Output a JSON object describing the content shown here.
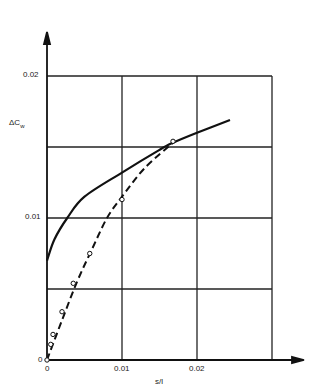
{
  "chart_data": {
    "type": "line",
    "title": "",
    "xlabel": "s/l",
    "ylabel": "ΔCw",
    "xlim": [
      0,
      0.03
    ],
    "ylim": [
      0,
      0.025
    ],
    "x_ticks": [
      "0",
      "0.01",
      "0.02"
    ],
    "y_ticks": [
      "0",
      "0.01",
      "0.02"
    ],
    "grid": true,
    "series": [
      {
        "name": "solid curve",
        "style": "solid",
        "points": [
          [
            0,
            0.007
          ],
          [
            0.001,
            0.0085
          ],
          [
            0.0027,
            0.01
          ],
          [
            0.005,
            0.0115
          ],
          [
            0.01,
            0.0132
          ],
          [
            0.015,
            0.0148
          ],
          [
            0.0168,
            0.0153
          ],
          [
            0.02,
            0.016
          ],
          [
            0.0244,
            0.0169
          ]
        ]
      },
      {
        "name": "dashed curve",
        "style": "dashed",
        "points": [
          [
            0,
            0
          ],
          [
            0.002,
            0.0028
          ],
          [
            0.004,
            0.0055
          ],
          [
            0.006,
            0.0078
          ],
          [
            0.008,
            0.01
          ],
          [
            0.01,
            0.0115
          ],
          [
            0.013,
            0.0135
          ],
          [
            0.0168,
            0.0153
          ]
        ]
      },
      {
        "name": "measured points",
        "style": "markers",
        "points": [
          [
            0,
            0
          ],
          [
            0.0005,
            0.0011
          ],
          [
            0.0008,
            0.0018
          ],
          [
            0.002,
            0.0034
          ],
          [
            0.0035,
            0.0054
          ],
          [
            0.0057,
            0.0075
          ],
          [
            0.01,
            0.0113
          ],
          [
            0.0168,
            0.0154
          ]
        ]
      }
    ]
  },
  "labels": {
    "y_axis": "ΔC",
    "y_axis_sub": "w",
    "x_axis": "s/l",
    "y_tick_002": "0.02",
    "y_tick_001": "0.01",
    "y_tick_0": "0",
    "x_tick_0": "0",
    "x_tick_001": "0.01",
    "x_tick_002": "0.02"
  }
}
